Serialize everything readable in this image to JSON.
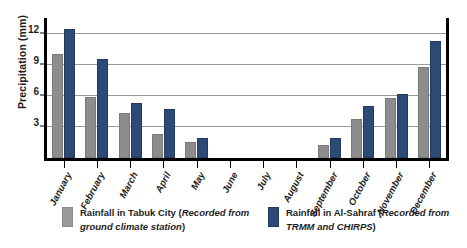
{
  "chart_data": {
    "type": "bar",
    "title": "",
    "xlabel": "",
    "ylabel": "Precipitation (mm)",
    "ylim": [
      0,
      13.5
    ],
    "yticks": [
      3,
      6,
      9,
      12
    ],
    "ytick_labels": [
      "3",
      "6",
      "9",
      "12"
    ],
    "grid": true,
    "legend_position": "bottom",
    "categories": [
      "January",
      "February",
      "March",
      "April",
      "May",
      "June",
      "July",
      "August",
      "September",
      "October",
      "November",
      "December"
    ],
    "series": [
      {
        "name": "Rainfall in Tabuk City",
        "source_note": "Recorded from ground climate station",
        "color": "#8d8d8d",
        "values": [
          10.0,
          5.9,
          4.3,
          2.3,
          1.5,
          0,
          0,
          0,
          1.3,
          3.8,
          5.8,
          8.8
        ]
      },
      {
        "name": "Rainfall in Al-Sahraf",
        "source_note": "Recorded from TRMM and CHIRPS",
        "color": "#2d4a77",
        "values": [
          12.4,
          9.5,
          5.3,
          4.7,
          1.9,
          0,
          0,
          0,
          1.9,
          5.0,
          6.2,
          11.3
        ]
      }
    ]
  },
  "legend": {
    "entries": [
      {
        "label_main": "Rainfall in Tabuk City (",
        "label_italic": "Recorded from ground climate station",
        "label_close": ")",
        "swatch_color": "#9b9b9b"
      },
      {
        "label_main": "Rainfall in Al-Sahraf (",
        "label_italic": "Recorded from TRMM and CHIRPS",
        "label_close": ")",
        "swatch_color": "#2d4a77"
      }
    ]
  }
}
